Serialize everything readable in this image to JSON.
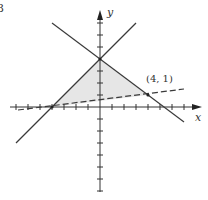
{
  "figure": {
    "corner_label": "3",
    "x_axis_label": "x",
    "y_axis_label": "y",
    "point_label": "(4, 1)",
    "colors": {
      "line": "#3a3a3a",
      "axis": "#333333",
      "fill": "#e6e6e6",
      "text": "#333333"
    }
  },
  "diagram_data": {
    "type": "linear_inequality_region",
    "origin_px": [
      100,
      107
    ],
    "unit_px": 12,
    "x_ticks": [
      -7,
      -6,
      -5,
      -4,
      -3,
      -2,
      -1,
      1,
      2,
      3,
      4,
      5,
      6,
      7
    ],
    "y_ticks": [
      -7,
      -6,
      -5,
      -4,
      -3,
      -2,
      -1,
      1,
      2,
      3,
      4,
      5,
      6,
      7
    ],
    "lines": [
      {
        "name": "rising",
        "equation": "y = x + 4",
        "style": "solid"
      },
      {
        "name": "falling",
        "equation": "y = -3/4 x + 4",
        "style": "solid"
      },
      {
        "name": "dashed",
        "equation": "y = x/8 + 1/2",
        "style": "dashed"
      }
    ],
    "shaded_region_vertices": [
      [
        -4,
        0
      ],
      [
        0,
        4
      ],
      [
        4,
        1
      ]
    ],
    "labeled_points": [
      {
        "label": "(4, 1)",
        "x": 4,
        "y": 1
      }
    ]
  }
}
